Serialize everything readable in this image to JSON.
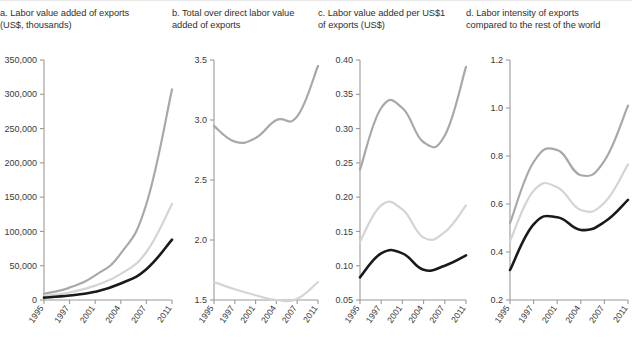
{
  "figure": {
    "width": 632,
    "height": 344,
    "background": "#ffffff"
  },
  "series_styles": {
    "series_a_color": "#a8a8a8",
    "series_b_color": "#d4d4d4",
    "series_c_color": "#1a1a1a"
  },
  "panels": {
    "a": {
      "title_line1": "a. Labor value added of exports",
      "title_line2": "(US$, thousands)"
    },
    "b": {
      "title_line1": "b. Total over direct labor value",
      "title_line2": "added of exports"
    },
    "c": {
      "title_line1": "c. Labor value added per US$1",
      "title_line2": "of exports (US$)"
    },
    "d": {
      "title_line1": "d. Labor intensity of exports",
      "title_line2": "compared to the rest of the world"
    }
  },
  "chart_data": [
    {
      "id": "panel-a",
      "type": "line",
      "title": "a. Labor value added of exports (US$, thousands)",
      "xlabel": "",
      "ylabel": "US$, thousands",
      "categories": [
        "1995",
        "1997",
        "2001",
        "2004",
        "2007",
        "2011"
      ],
      "ytick_labels": [
        "0",
        "50,000",
        "100,000",
        "150,000",
        "200,000",
        "250,000",
        "300,000",
        "350,000"
      ],
      "ytick_values": [
        0,
        50000,
        100000,
        150000,
        200000,
        250000,
        300000,
        350000
      ],
      "ylim": [
        0,
        350000
      ],
      "grid": false,
      "legend": "none",
      "series": [
        {
          "name": "series-1",
          "color": "#a8a8a8",
          "values": [
            9000,
            18000,
            36000,
            68000,
            140000,
            307000
          ]
        },
        {
          "name": "series-2",
          "color": "#d4d4d4",
          "values": [
            6000,
            11000,
            21000,
            38000,
            70000,
            140000
          ]
        },
        {
          "name": "series-3",
          "color": "#1a1a1a",
          "values": [
            3500,
            6500,
            12000,
            24000,
            45000,
            88000
          ]
        }
      ]
    },
    {
      "id": "panel-b",
      "type": "line",
      "title": "b. Total over direct labor value added of exports",
      "xlabel": "",
      "ylabel": "",
      "categories": [
        "1995",
        "1997",
        "2001",
        "2004",
        "2007",
        "2011"
      ],
      "ytick_labels": [
        "1.5",
        "2.0",
        "2.5",
        "3.0",
        "3.5"
      ],
      "ytick_values": [
        1.5,
        2.0,
        2.5,
        3.0,
        3.5
      ],
      "ylim": [
        1.5,
        3.5
      ],
      "grid": false,
      "legend": "none",
      "series": [
        {
          "name": "series-1",
          "color": "#a8a8a8",
          "values": [
            2.95,
            2.82,
            2.85,
            3.0,
            3.03,
            3.45
          ]
        },
        {
          "name": "series-2",
          "color": "#d4d4d4",
          "values": [
            1.65,
            1.59,
            1.54,
            1.5,
            1.51,
            1.65
          ]
        }
      ]
    },
    {
      "id": "panel-c",
      "type": "line",
      "title": "c. Labor value added per US$1 of exports (US$)",
      "xlabel": "",
      "ylabel": "US$",
      "categories": [
        "1995",
        "1997",
        "2001",
        "2004",
        "2007",
        "2011"
      ],
      "ytick_labels": [
        "0.05",
        "0.10",
        "0.15",
        "0.20",
        "0.25",
        "0.30",
        "0.35",
        "0.40"
      ],
      "ytick_values": [
        0.05,
        0.1,
        0.15,
        0.2,
        0.25,
        0.3,
        0.35,
        0.4
      ],
      "ylim": [
        0.05,
        0.4
      ],
      "grid": false,
      "legend": "none",
      "series": [
        {
          "name": "series-1",
          "color": "#a8a8a8",
          "values": [
            0.24,
            0.33,
            0.33,
            0.28,
            0.29,
            0.39
          ]
        },
        {
          "name": "series-2",
          "color": "#d4d4d4",
          "values": [
            0.135,
            0.188,
            0.182,
            0.141,
            0.149,
            0.188
          ]
        },
        {
          "name": "series-3",
          "color": "#1a1a1a",
          "values": [
            0.083,
            0.118,
            0.118,
            0.094,
            0.1,
            0.115
          ]
        }
      ]
    },
    {
      "id": "panel-d",
      "type": "line",
      "title": "d. Labor intensity of exports compared to the rest of the world",
      "xlabel": "",
      "ylabel": "",
      "categories": [
        "1995",
        "1997",
        "2001",
        "2004",
        "2007",
        "2011"
      ],
      "ytick_labels": [
        "0.2",
        "0.4",
        "0.6",
        "0.8",
        "1.0",
        "1.2"
      ],
      "ytick_values": [
        0.2,
        0.4,
        0.6,
        0.8,
        1.0,
        1.2
      ],
      "ylim": [
        0.2,
        1.2
      ],
      "grid": false,
      "legend": "none",
      "series": [
        {
          "name": "series-1",
          "color": "#a8a8a8",
          "values": [
            0.52,
            0.775,
            0.825,
            0.72,
            0.78,
            1.01
          ]
        },
        {
          "name": "series-2",
          "color": "#d4d4d4",
          "values": [
            0.445,
            0.655,
            0.67,
            0.575,
            0.605,
            0.765
          ]
        },
        {
          "name": "series-3",
          "color": "#1a1a1a",
          "values": [
            0.325,
            0.515,
            0.545,
            0.492,
            0.525,
            0.617
          ]
        }
      ]
    }
  ]
}
